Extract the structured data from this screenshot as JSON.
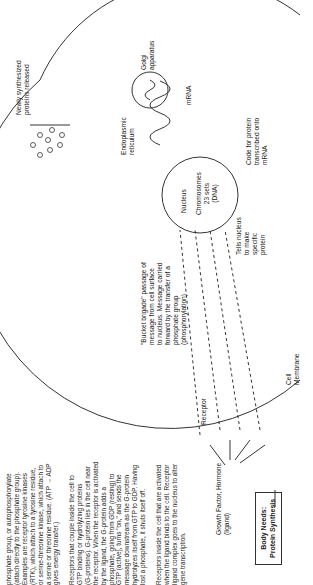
{
  "title_box": {
    "line1": "Body Needs:",
    "line2": "Protein Synthesis"
  },
  "labels": {
    "ligand": "Growth Factor, Hormone\n(ligand)",
    "receptor": "Receptor",
    "cell_membrane": "Cell\nMembrane",
    "bucket_brigade": "\"Bucket brigade\" passage of\nmessage from cell surface\nto nucleus. Message carried\nforward by the transfer of a\nphosphate group\n(phosphorylation)",
    "tells_nucleus": "Tells nucleus\nto make\nspecific\nprotein",
    "nucleus": "Nucleus",
    "chromosomes": "Chromosomes\n23 sets\n(DNA)",
    "code_for_protein": "Code for protein\ntranscribed onto\nmRNA",
    "er": "Endoplasmic\nreticulum",
    "mrna": "mRNA",
    "golgi": "Golgi\napparatus",
    "proteins_released": "Newly synthesized\nproteins released"
  },
  "paragraphs": [
    "phosphate group, or autophosphorylate\n(attach directly to the phosphate group).\nExamples are receptor tyrosine kinases\n(RTK), which attach to a tyrosine residue,\nor serine-threonine kinase, which attach to\na serine or threonine residue. (ATP → ADP\ngives energy transfer.)",
    "Receptors that couple inside the cell to\nGTP binding or hydrolyzing proteins\n(G-proteins). G-protein lies in the cell near\nthe receptor. When the receptor is activated\nby the ligand, the G-protein adds a\nphosphate, going from GDP (resting) to\nGTP (active), turns \"on,\" and sends the\nmessage downstream as the G-protein\nhydrolyzes itself from GTP to GDP. Having\nlost a phosphate, it shuts itself off.",
    "Receptors inside the cell that are activated\nwhen the ligand binds to the cell. Receptor\nligand complex goes to the nucleus to alter\ngene transcription."
  ]
}
